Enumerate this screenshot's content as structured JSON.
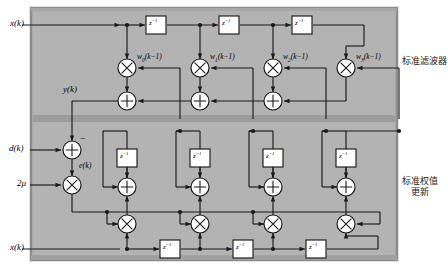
{
  "figure": {
    "type": "block-diagram",
    "taps": 4,
    "background_color": "#b3b3b3",
    "divider_color": "#9a9a9a",
    "border_color": "#8c8c8c",
    "line_color": "#1a1a1a",
    "node_fill": "#ffffff"
  },
  "sections": {
    "filter": {
      "label": "标准滤波器",
      "label_x": 381,
      "label_y": 56
    },
    "weight_update": {
      "label_line1": "标准权值",
      "label_line2": "更新",
      "label_x": 381,
      "label_y": 182
    }
  },
  "signals": {
    "x_top": "x(k)",
    "x_bottom": "x(k)",
    "y": "y(k)",
    "d": "d(k)",
    "e": "e(k)",
    "mu": "2μ",
    "minus": "−"
  },
  "delay_label": "z",
  "delay_exponent": "−1",
  "weights": [
    {
      "label": "w",
      "index": "0",
      "arg": "(k−1)"
    },
    {
      "label": "w",
      "index": "1",
      "arg": "(k−1)"
    },
    {
      "label": "w",
      "index": "2",
      "arg": "(k−1)"
    },
    {
      "label": "w",
      "index": "3",
      "arg": "(k−1)"
    }
  ],
  "weight_text": [
    "w0(k−1)",
    "w1(k−1)",
    "w2(k−1)",
    "w3(k−1)"
  ],
  "operators": {
    "multiply": "×",
    "add": "+"
  },
  "geometry": {
    "panel": {
      "x": 31,
      "y": 8,
      "w": 366,
      "h": 252
    },
    "divider_y": 119,
    "columns": [
      127,
      200,
      273,
      346
    ],
    "top_line_y": 25,
    "mult_row_y": 68,
    "sum_row_y": 101,
    "delay_row_y": 25,
    "err_sum": {
      "x": 62,
      "y": 150
    },
    "mu_mult": {
      "x": 62,
      "y": 185
    },
    "wsum_row_y": 187,
    "wdelay_row_y": 158,
    "wmult_row_y": 224,
    "xline_bottom_y": 249
  }
}
